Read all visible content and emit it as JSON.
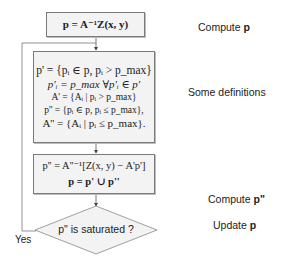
{
  "diagram": {
    "boxes": {
      "compute_p": {
        "formula": "p = A⁻¹Z(x, y)"
      },
      "definitions": {
        "lines": [
          "p' = {pᵢ ∈ p, pᵢ > p_max}",
          "p'ᵢ = p_max ∀p'ᵢ ∈ p'",
          "A' = {Aᵢ | pᵢ > p_max}",
          "p'' = {pᵢ ∈ p, pᵢ ≤ p_max},",
          "A'' = {Aᵢ | pᵢ ≤ p_max}."
        ]
      },
      "compute_p2": {
        "lines": [
          "p'' = A''⁻¹[Z(x, y) − A'p']",
          "p = p' ∪ p''"
        ]
      }
    },
    "decision": {
      "text": "p\" is saturated ?",
      "yes_label": "Yes"
    },
    "side_labels": [
      {
        "text": "Compute ",
        "bold": "p"
      },
      {
        "text": "Some definitions",
        "bold": ""
      },
      {
        "text": "Compute ",
        "bold": "p\""
      },
      {
        "text": "Update ",
        "bold": "p"
      }
    ]
  }
}
